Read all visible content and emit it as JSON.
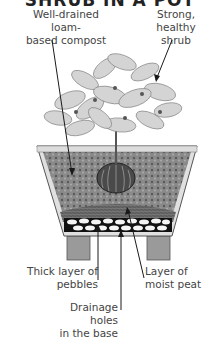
{
  "title": "SHRUB IN A POT",
  "labels": {
    "compost": [
      "Well-drained loam-",
      "based compost"
    ],
    "shrub": [
      "Strong, healthy",
      "shrub"
    ],
    "pebbles": [
      "Thick layer of",
      "pebbles"
    ],
    "peat": [
      "Layer of",
      "moist peat"
    ],
    "drainage": [
      "Drainage holes",
      "in the base"
    ]
  },
  "colors": {
    "line": "#1a1a1a",
    "soil": "#6f6f6f",
    "pot": "#d9d9d9",
    "foliage": "#bdbdbd"
  }
}
